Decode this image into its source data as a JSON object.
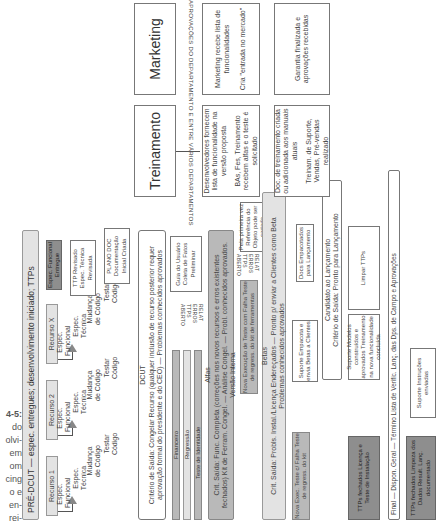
{
  "caption": {
    "fig_label": "4-5:",
    "lines": [
      "do",
      "olvi-",
      "em",
      "om",
      "cing",
      "o e",
      "en-",
      "rei-"
    ]
  },
  "predcut": {
    "title": "PRÉ-DCUT — espec. entregues; desenvolvimento iniciado; TTPs",
    "resources": [
      {
        "name": "Recurso 1",
        "func": "Espec. Funcional",
        "tech": "Espec. Técnica",
        "change": "Mudança de Código",
        "test": "Testar Código"
      },
      {
        "name": "Recurso 2",
        "func": "Espec. Funcional",
        "tech": "Espec. Técnica",
        "change": "Mudança de Código",
        "test": "Testar Código"
      },
      {
        "name": "Recurso X",
        "func": "Espec. Funcional",
        "tech": "Espec. Técnica",
        "change": "Mudança de Código",
        "test": "Testar Código"
      }
    ],
    "spec_delivered": "Espec. Funcional Entregue",
    "ttp_reviewed": "TTP Revisado Espec. Técnica Revisada",
    "plan_doc": "PLANO DOC Documentação Inicial Criada"
  },
  "dcut": {
    "title": "DCUT",
    "criteria": "Critério de Saída: Congelar Recurso (qualquer inclusão de recurso posterior requer aprovação formal do presidente e do CEO) — Problemas conhecidos aprovados",
    "bars": [
      "Financeiro",
      "Regressão",
      "Teste de Identidade"
    ],
    "relat_label": "RELAT ERROS TTPS ABERTO",
    "user_guide": "Guia do Usuário Coleta de Fatos Preliminar"
  },
  "alfas": {
    "title": "Alfas",
    "criteria": "Crit. Saída: Func. Completa (correções nos novos recursos e erros existentes fechados) Kit de Ferram. Congel. — Análise Congel. — Probl. conhecidos aprovados. Versão Interna",
    "rerun": "Nova Execução de Teste com Falha Teste de regress. do kit de ferramentas",
    "relat_label": "RELAT ERROS TTPS ABERTO",
    "first_ref": "Pela primeira vez Referência do Objeto pode ser cortada"
  },
  "betas": {
    "title": "Betas",
    "criteria": "Crit. Saída: Probls. Instal./Licença Endereçados — Pronto p/ enviar a Clientes como Beta Problemas conhecidos aprovados",
    "rerun": "Nova Exec. Teste c/ Falha Teste de regress. do kit",
    "support": "Suporte Empacota e envia Betas a Clientes",
    "docs": "Docs Empacotados para Lançamento"
  },
  "candidate": {
    "title": "Candidato ao Lançamento",
    "criteria": "Critério de Saída: Pronto para Lançamento",
    "ttps": "TTPs fechados Licença e Teste de Instalação",
    "support": "Suporte Modelos construídos e aprovados Treinamento na nova funcionalidade concluída",
    "clean": "Limpar TTPs"
  },
  "final": {
    "criteria": "Final — Dispon. Geral — Término Lista de Verific. Lanç. das Dps. de Campo e Aprovações",
    "ttps": "TTPs fechados Limpeza dos Dados Result. Lanç. documentado",
    "support": "Suporte Instruções enviadas"
  },
  "departments": {
    "approvals_label": "APROVAÇÕES DO DEPARTAMENTO E ENTRE VÁRIOS DEPARTAMENTOS",
    "training": {
      "title": "Treinamento",
      "box1_a": "Desenvolvedores fornecem lista de funcionalidade na versão proposta",
      "box1_b": "BAs, Fes, Treinamento recebem alfas e o teste é solicitado",
      "box2_a": "Doc. de treinamento criada ou adicionada aos manuais atuais",
      "box2_b": "Treinam. de Suporte, Vendas, Pré-vendas realizado"
    },
    "marketing": {
      "title": "Marketing",
      "box1_a": "Marketing recebe lista de funcionalidades",
      "box1_b": "Cria \"entrada no mercado\"",
      "box2_a": "Garantia finalizada e aprovações recebidas"
    }
  }
}
